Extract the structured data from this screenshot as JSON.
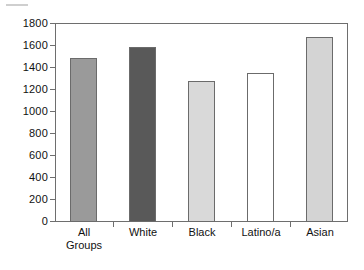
{
  "chart_data": {
    "type": "bar",
    "title": "",
    "subtitle": "",
    "xlabel": "",
    "ylabel": "",
    "categories": [
      "All Groups",
      "White",
      "Black",
      "Latino/a",
      "Asian"
    ],
    "category_lines": [
      [
        "All",
        "Groups"
      ],
      [
        "White"
      ],
      [
        "Black"
      ],
      [
        "Latino/a"
      ],
      [
        "Asian"
      ]
    ],
    "values": [
      1480,
      1580,
      1275,
      1350,
      1670
    ],
    "series": [
      {
        "name": "",
        "values": [
          1480,
          1580,
          1275,
          1350,
          1670
        ]
      }
    ],
    "bar_colors": [
      "#9a9a9a",
      "#595959",
      "#d9d9d9",
      "#ffffff",
      "#d4d4d4"
    ],
    "bar_border_color": "#6b6b6b",
    "ylim": [
      0,
      1800
    ],
    "ytick_step": 200,
    "yticks": [
      0,
      200,
      400,
      600,
      800,
      1000,
      1200,
      1400,
      1600,
      1800
    ],
    "ytick_labels": [
      "0",
      "200",
      "400",
      "600",
      "800",
      "1000",
      "1200",
      "1400",
      "1600",
      "1800"
    ],
    "grid": false,
    "legend": null,
    "legend_position": "none",
    "axis_color": "#6e6e6e",
    "background": "#ffffff",
    "annotations": []
  }
}
